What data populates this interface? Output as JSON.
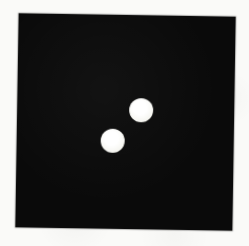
{
  "scene": {
    "paper_color": "#fafaf8",
    "card": {
      "color": "#0a0a0a",
      "left_px": 17,
      "top_px": 15,
      "width_px": 217,
      "height_px": 214,
      "rotation_deg": 0.9
    },
    "dots": [
      {
        "id": "upper-right",
        "center_x_px": 141,
        "center_y_px": 110,
        "diameter_px": 24,
        "color": "#f4f4ee"
      },
      {
        "id": "lower-left",
        "center_x_px": 113,
        "center_y_px": 141,
        "diameter_px": 24,
        "color": "#f4f4ee"
      }
    ],
    "dot_count": 2
  }
}
